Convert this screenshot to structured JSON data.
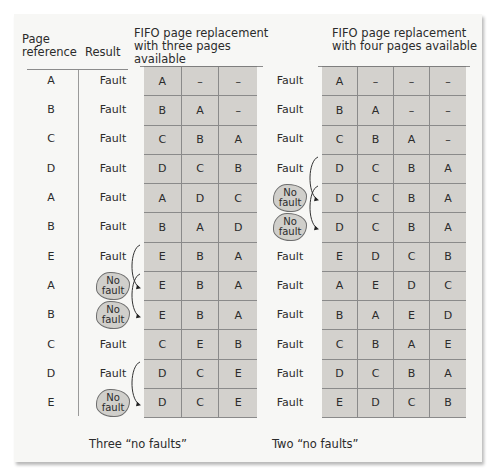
{
  "headers": {
    "page_reference_line1": "Page",
    "page_reference_line2": "reference",
    "result": "Result",
    "three_line1": "FIFO page replacement",
    "three_line2": "with three pages available",
    "four_line1": "FIFO page replacement",
    "four_line2": "with four pages available"
  },
  "rows": [
    {
      "ref": "A",
      "res3": "Fault",
      "res4": "Fault",
      "three": [
        "A",
        "–",
        "–"
      ],
      "four": [
        "A",
        "–",
        "–",
        "–"
      ]
    },
    {
      "ref": "B",
      "res3": "Fault",
      "res4": "Fault",
      "three": [
        "B",
        "A",
        "–"
      ],
      "four": [
        "B",
        "A",
        "–",
        "–"
      ]
    },
    {
      "ref": "C",
      "res3": "Fault",
      "res4": "Fault",
      "three": [
        "C",
        "B",
        "A"
      ],
      "four": [
        "C",
        "B",
        "A",
        "–"
      ]
    },
    {
      "ref": "D",
      "res3": "Fault",
      "res4": "Fault",
      "three": [
        "D",
        "C",
        "B"
      ],
      "four": [
        "D",
        "C",
        "B",
        "A"
      ]
    },
    {
      "ref": "A",
      "res3": "Fault",
      "res4": "No fault",
      "three": [
        "A",
        "D",
        "C"
      ],
      "four": [
        "D",
        "C",
        "B",
        "A"
      ]
    },
    {
      "ref": "B",
      "res3": "Fault",
      "res4": "No fault",
      "three": [
        "B",
        "A",
        "D"
      ],
      "four": [
        "D",
        "C",
        "B",
        "A"
      ]
    },
    {
      "ref": "E",
      "res3": "Fault",
      "res4": "Fault",
      "three": [
        "E",
        "B",
        "A"
      ],
      "four": [
        "E",
        "D",
        "C",
        "B"
      ]
    },
    {
      "ref": "A",
      "res3": "No fault",
      "res4": "Fault",
      "three": [
        "E",
        "B",
        "A"
      ],
      "four": [
        "A",
        "E",
        "D",
        "C"
      ]
    },
    {
      "ref": "B",
      "res3": "No fault",
      "res4": "Fault",
      "three": [
        "E",
        "B",
        "A"
      ],
      "four": [
        "B",
        "A",
        "E",
        "D"
      ]
    },
    {
      "ref": "C",
      "res3": "Fault",
      "res4": "Fault",
      "three": [
        "C",
        "E",
        "B"
      ],
      "four": [
        "C",
        "B",
        "A",
        "E"
      ]
    },
    {
      "ref": "D",
      "res3": "Fault",
      "res4": "Fault",
      "three": [
        "D",
        "C",
        "E"
      ],
      "four": [
        "D",
        "C",
        "B",
        "A"
      ]
    },
    {
      "ref": "E",
      "res3": "No fault",
      "res4": "Fault",
      "three": [
        "D",
        "C",
        "E"
      ],
      "four": [
        "E",
        "D",
        "C",
        "B"
      ]
    }
  ],
  "badge": {
    "line1": "No",
    "line2": "fault"
  },
  "captions": {
    "three": "Three “no faults”",
    "four": "Two “no faults”"
  },
  "colors": {
    "panel": "#f7f7f5",
    "cell_fill": "#d3d1cd",
    "badge_fill": "#d0cfcb",
    "text": "#2b2b2b"
  }
}
